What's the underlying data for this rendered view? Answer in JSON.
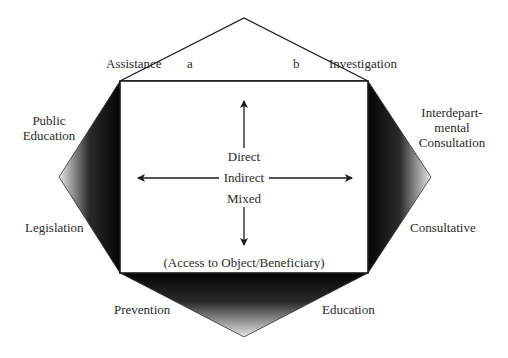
{
  "diagram": {
    "top_labels": {
      "left": "Assistance",
      "a": "a",
      "b": "b",
      "right": "Investigation"
    },
    "left_labels": {
      "upper_line1": "Public",
      "upper_line2": "Education",
      "lower": "Legislation"
    },
    "right_labels": {
      "upper_line1": "Interdepart-",
      "upper_line2": "mental",
      "upper_line3": "Consultation",
      "lower": "Consultative"
    },
    "bottom_labels": {
      "left": "Prevention",
      "right": "Education"
    },
    "center": {
      "direct": "Direct",
      "indirect": "Indirect",
      "mixed": "Mixed",
      "caption": "(Access to Object/Beneficiary)"
    },
    "colors": {
      "stroke": "#1a1a1a",
      "dark_fill": "#0a0a0a",
      "light_fill": "#e0e0e0",
      "background": "#ffffff"
    }
  }
}
